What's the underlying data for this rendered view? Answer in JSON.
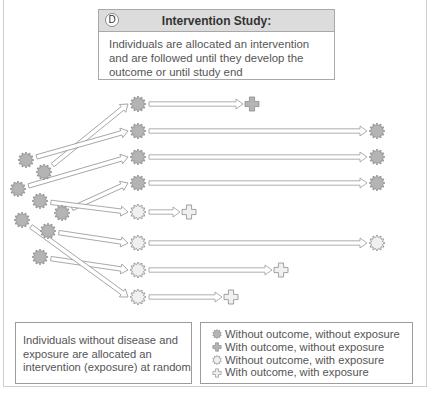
{
  "panel": {
    "badge": "D",
    "title": "Intervention Study:",
    "description": "Individuals are allocated an intervention and are followed until they develop the outcome or until study end"
  },
  "note": {
    "text": "Individuals without disease and exposure are allocated an intervention (exposure) at random"
  },
  "legend": {
    "items": [
      {
        "symbol": "star-dark",
        "label": "Without outcome, without exposure"
      },
      {
        "symbol": "cross-dark",
        "label": "With outcome, without exposure"
      },
      {
        "symbol": "star-light",
        "label": "Without outcome, with exposure"
      },
      {
        "symbol": "cross-light",
        "label": "With outcome, with exposure"
      }
    ]
  },
  "colors": {
    "dark_fill": "#b4b4b4",
    "light_fill": "#f0f0f0",
    "stroke": "#8c8c8c",
    "arrow_stroke": "#9a9a9a",
    "header_bg": "#dcdcdc"
  },
  "diagram": {
    "sources": [
      {
        "x": 26,
        "y": 160
      },
      {
        "x": 44,
        "y": 172
      },
      {
        "x": 18,
        "y": 189
      },
      {
        "x": 40,
        "y": 201
      },
      {
        "x": 62,
        "y": 213
      },
      {
        "x": 22,
        "y": 220
      },
      {
        "x": 48,
        "y": 231
      },
      {
        "x": 40,
        "y": 257
      }
    ],
    "rows": [
      {
        "y": 104,
        "group": "unexposed",
        "from": 1,
        "end_x": 243,
        "outcome": true
      },
      {
        "y": 131,
        "group": "unexposed",
        "from": 0,
        "end_x": 367,
        "outcome": false
      },
      {
        "y": 157,
        "group": "unexposed",
        "from": 2,
        "end_x": 367,
        "outcome": false
      },
      {
        "y": 183,
        "group": "unexposed",
        "from": 4,
        "end_x": 367,
        "outcome": false
      },
      {
        "y": 212,
        "group": "exposed",
        "from": 3,
        "end_x": 180,
        "outcome": true
      },
      {
        "y": 243,
        "group": "exposed",
        "from": 6,
        "end_x": 367,
        "outcome": false
      },
      {
        "y": 270,
        "group": "exposed",
        "from": 7,
        "end_x": 272,
        "outcome": true
      },
      {
        "y": 297,
        "group": "exposed",
        "from": 5,
        "end_x": 222,
        "outcome": true
      }
    ]
  }
}
